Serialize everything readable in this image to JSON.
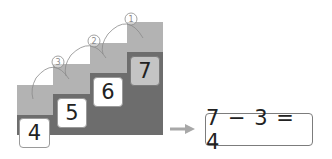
{
  "staircase": {
    "steps": [
      {
        "value": "4",
        "highlighted": false
      },
      {
        "value": "5",
        "highlighted": false
      },
      {
        "value": "6",
        "highlighted": false
      },
      {
        "value": "7",
        "highlighted": true
      }
    ],
    "jump_labels": [
      "①",
      "②",
      "③"
    ]
  },
  "result": {
    "arrow": "→",
    "equation": "7 − 3 = 4"
  },
  "colors": {
    "step_top": "#b3b3b3",
    "step_base": "#6d6d6d",
    "highlight_box": "#c4c4c4"
  }
}
